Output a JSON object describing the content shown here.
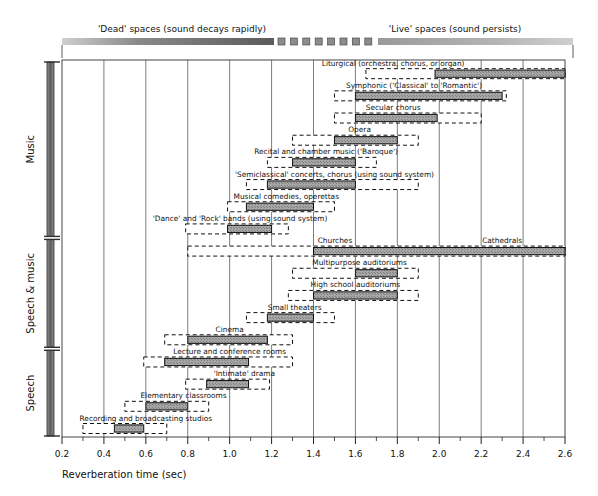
{
  "header": {
    "left_label": "'Dead' spaces (sound decays rapidly)",
    "right_label": "'Live' spaces (sound persists)"
  },
  "axis": {
    "title": "Reverberation time (sec)",
    "ticks": [
      "0.2",
      "0.4",
      "0.6",
      "0.8",
      "1.0",
      "1.2",
      "1.4",
      "1.6",
      "1.8",
      "2.0",
      "2.2",
      "2.4",
      "2.6"
    ],
    "min": 0.2,
    "max": 2.6,
    "step": 0.2
  },
  "groups": [
    {
      "name": "Music",
      "label": "Music"
    },
    {
      "name": "Speech & music",
      "label": "Speech & music"
    },
    {
      "name": "Speech",
      "label": "Speech"
    }
  ],
  "colors": {
    "fill": "#9a9a9a",
    "stroke": "#111111",
    "bracket": "#6e6e6e",
    "grid": "#444444"
  },
  "chart_data": {
    "type": "bar",
    "xlabel": "Reverberation time (sec)",
    "ylabel": "",
    "xlim": [
      0.2,
      2.6
    ],
    "grid": true,
    "legend": "none",
    "note": "Each row: outer dashed box = acceptable range; inner solid grey bar = optimum range, in seconds.",
    "categories": [
      "Liturgical (orchestra, chorus, or organ)",
      "Symphonic ('Classical' to 'Romantic')",
      "Secular chorus",
      "Opera",
      "Recital and chamber music ('Baroque')",
      "'Semiclassical' concerts, chorus (using sound system)",
      "Musical comedies, operettas",
      "'Dance' and 'Rock' bands (using sound system)",
      "Churches / Cathedrals",
      "Multipurpose auditoriums",
      "High school auditoriums",
      "Small theaters",
      "Cinema",
      "Lecture and conference rooms",
      "'Intimate' drama",
      "Elementary classrooms",
      "Recording and broadcasting studios"
    ],
    "rows": [
      {
        "label": "Liturgical (orchestra, chorus, or organ)",
        "group": "Music",
        "label_text": "Liturgical (orchestra, chorus, or organ)",
        "outer": [
          1.65,
          2.6
        ],
        "inner": [
          1.98,
          2.6
        ],
        "label_x": 1.78,
        "label_anchor": "middle",
        "inner_open_right": true
      },
      {
        "label": "Symphonic ('Classical' to 'Romantic')",
        "group": "Music",
        "label_text": "Symphonic ('Classical' to 'Romantic')",
        "outer": [
          1.5,
          2.32
        ],
        "inner": [
          1.6,
          2.3
        ],
        "label_x": 1.88,
        "label_anchor": "middle"
      },
      {
        "label": "Secular chorus",
        "group": "Music",
        "label_text": "Secular chorus",
        "outer": [
          1.5,
          2.2
        ],
        "inner": [
          1.6,
          1.99
        ],
        "label_x": 1.78,
        "label_anchor": "middle"
      },
      {
        "label": "Opera",
        "group": "Music",
        "label_text": "Opera",
        "outer": [
          1.3,
          1.9
        ],
        "inner": [
          1.5,
          1.8
        ],
        "label_x": 1.62,
        "label_anchor": "middle"
      },
      {
        "label": "Recital and chamber music ('Baroque')",
        "group": "Music",
        "label_text": "Recital and chamber music ('Baroque')",
        "outer": [
          1.18,
          1.7
        ],
        "inner": [
          1.3,
          1.6
        ],
        "label_x": 1.46,
        "label_anchor": "middle"
      },
      {
        "label": "'Semiclassical' concerts, chorus (using sound system)",
        "group": "Music",
        "label_text": "'Semiclassical' concerts, chorus (using sound system)",
        "outer": [
          1.08,
          1.9
        ],
        "inner": [
          1.18,
          1.6
        ],
        "label_x": 1.5,
        "label_anchor": "middle"
      },
      {
        "label": "Musical comedies, operettas",
        "group": "Music",
        "label_text": "Musical comedies, operettas",
        "outer": [
          0.99,
          1.5
        ],
        "inner": [
          1.08,
          1.4
        ],
        "label_x": 1.27,
        "label_anchor": "middle"
      },
      {
        "label": "'Dance' and 'Rock' bands (using sound system)",
        "group": "Music",
        "label_text": "'Dance' and 'Rock' bands (using sound system)",
        "outer": [
          0.79,
          1.28
        ],
        "inner": [
          0.99,
          1.2
        ],
        "label_x": 1.05,
        "label_anchor": "middle"
      },
      {
        "label": "Churches / Cathedrals",
        "group": "Speech & music",
        "label_text": "Churches",
        "label2_text": "Cathedrals",
        "outer": [
          0.8,
          2.6
        ],
        "inner": [
          1.4,
          2.6
        ],
        "label_x": 1.42,
        "label_anchor": "start",
        "label2_x": 2.3,
        "label2_anchor": "middle",
        "inner_open_right": true
      },
      {
        "label": "Multipurpose auditoriums",
        "group": "Speech & music",
        "label_text": "Multipurpose auditoriums",
        "outer": [
          1.3,
          1.9
        ],
        "inner": [
          1.6,
          1.8
        ],
        "label_x": 1.62,
        "label_anchor": "middle"
      },
      {
        "label": "High school auditoriums",
        "group": "Speech & music",
        "label_text": "High school auditoriums",
        "outer": [
          1.28,
          1.9
        ],
        "inner": [
          1.4,
          1.8
        ],
        "label_x": 1.6,
        "label_anchor": "middle"
      },
      {
        "label": "Small theaters",
        "group": "Speech & music",
        "label_text": "Small theaters",
        "outer": [
          1.08,
          1.5
        ],
        "inner": [
          1.18,
          1.4
        ],
        "label_x": 1.31,
        "label_anchor": "middle"
      },
      {
        "label": "Cinema",
        "group": "Speech & music",
        "label_text": "Cinema",
        "outer": [
          0.69,
          1.3
        ],
        "inner": [
          0.8,
          1.18
        ],
        "label_x": 1.0,
        "label_anchor": "middle"
      },
      {
        "label": "Lecture and conference rooms",
        "group": "Speech",
        "label_text": "Lecture and conference rooms",
        "outer": [
          0.59,
          1.3
        ],
        "inner": [
          0.69,
          1.09
        ],
        "label_x": 1.0,
        "label_anchor": "middle"
      },
      {
        "label": "'Intimate' drama",
        "group": "Speech",
        "label_text": "'Intimate' drama",
        "outer": [
          0.79,
          1.19
        ],
        "inner": [
          0.89,
          1.09
        ],
        "label_x": 1.07,
        "label_anchor": "middle"
      },
      {
        "label": "Elementary classrooms",
        "group": "Speech",
        "label_text": "Elementary classrooms",
        "outer": [
          0.5,
          0.9
        ],
        "inner": [
          0.6,
          0.8
        ],
        "label_x": 0.78,
        "label_anchor": "middle"
      },
      {
        "label": "Recording and broadcasting studios",
        "group": "Speech",
        "label_text": "Recording and broadcasting studios",
        "outer": [
          0.3,
          0.7
        ],
        "inner": [
          0.45,
          0.59
        ],
        "label_x": 0.6,
        "label_anchor": "middle"
      }
    ]
  }
}
